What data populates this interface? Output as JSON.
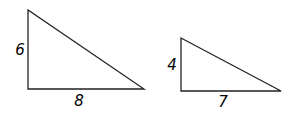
{
  "triangles": [
    {
      "id": "triangle-1",
      "vertices": [
        [
          28,
          10
        ],
        [
          28,
          89
        ],
        [
          144,
          89
        ]
      ],
      "labels": {
        "vertical_leg": {
          "text": "6",
          "x": 20,
          "y": 55
        },
        "horizontal_leg": {
          "text": "8",
          "x": 79,
          "y": 106
        }
      }
    },
    {
      "id": "triangle-2",
      "vertices": [
        [
          181,
          38
        ],
        [
          181,
          91
        ],
        [
          281,
          91
        ]
      ],
      "labels": {
        "vertical_leg": {
          "text": "4",
          "x": 172,
          "y": 70
        },
        "horizontal_leg": {
          "text": "7",
          "x": 223,
          "y": 107
        }
      }
    }
  ],
  "stroke_color": "#222222"
}
